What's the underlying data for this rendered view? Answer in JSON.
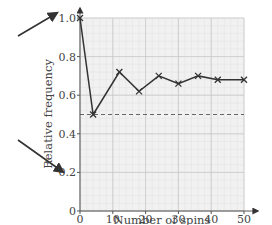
{
  "chart_data": {
    "type": "line",
    "title": "",
    "xlabel": "Number of spins",
    "ylabel": "Relative frequency",
    "xlim": [
      0,
      50
    ],
    "ylim": [
      0,
      1.0
    ],
    "x_ticks": [
      0,
      10,
      20,
      30,
      40,
      50
    ],
    "x_tick_labels": [
      "0",
      "10",
      "20",
      "30",
      "40",
      "50"
    ],
    "y_ticks": [
      0,
      0.2,
      0.4,
      0.6,
      0.8,
      1.0
    ],
    "y_tick_labels": [
      "0",
      "0.2",
      "0.4",
      "0.6",
      "0.8",
      "1.0"
    ],
    "grid": true,
    "series": [
      {
        "name": "Relative frequency",
        "marker": "x",
        "x": [
          0,
          4,
          12,
          18,
          24,
          30,
          36,
          42,
          50
        ],
        "values": [
          1.0,
          0.5,
          0.72,
          0.62,
          0.7,
          0.66,
          0.7,
          0.68,
          0.68
        ]
      }
    ],
    "reference_line": {
      "y": 0.5,
      "style": "dashed"
    },
    "annotations": [
      {
        "type": "arrow",
        "points_to": "y-axis value 1.0"
      },
      {
        "type": "arrow",
        "points_to": "origin / y-axis value 0"
      }
    ]
  },
  "colors": {
    "grid_major": "#c8c8c8",
    "grid_minor": "#e4e4e4",
    "plot_bg": "#f1f1f1",
    "line": "#333333",
    "axis": "#555555",
    "text": "#444444"
  }
}
